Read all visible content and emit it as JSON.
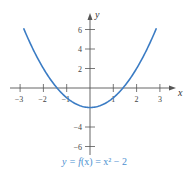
{
  "chart_data": {
    "type": "line",
    "title": "",
    "caption": "y = f(x) = x² − 2",
    "function": "x^2 - 2",
    "xlabel": "x",
    "ylabel": "y",
    "xlim": [
      -3.5,
      3.5
    ],
    "ylim": [
      -7,
      7
    ],
    "x_ticks": [
      -3,
      -2,
      -1,
      1,
      2,
      3
    ],
    "y_ticks": [
      6,
      4,
      2,
      -4,
      -6
    ],
    "x_tick_labels": [
      "−3",
      "−2",
      "−1",
      "1",
      "2",
      "3"
    ],
    "y_tick_labels": [
      "6",
      "4",
      "2",
      "−4",
      "−6"
    ],
    "grid": false,
    "legend": null,
    "series": [
      {
        "name": "y = x² − 2",
        "color": "#3b7cc4",
        "x": [
          -2.85,
          -2.5,
          -2,
          -1.5,
          -1,
          -0.5,
          0,
          0.5,
          1,
          1.5,
          2,
          2.5,
          2.85
        ],
        "y": [
          6.12,
          4.25,
          2,
          0.25,
          -1,
          -1.75,
          -2,
          -1.75,
          -1,
          0.25,
          2,
          4.25,
          6.12
        ]
      }
    ]
  },
  "labels": {
    "x_axis": "x",
    "y_axis": "y",
    "caption_prefix": "y = ",
    "caption_func": "f",
    "caption_rest": "(x) = x² − 2"
  },
  "colors": {
    "curve": "#3b7cc4",
    "caption": "#4a8fd0",
    "axis": "#555555"
  }
}
